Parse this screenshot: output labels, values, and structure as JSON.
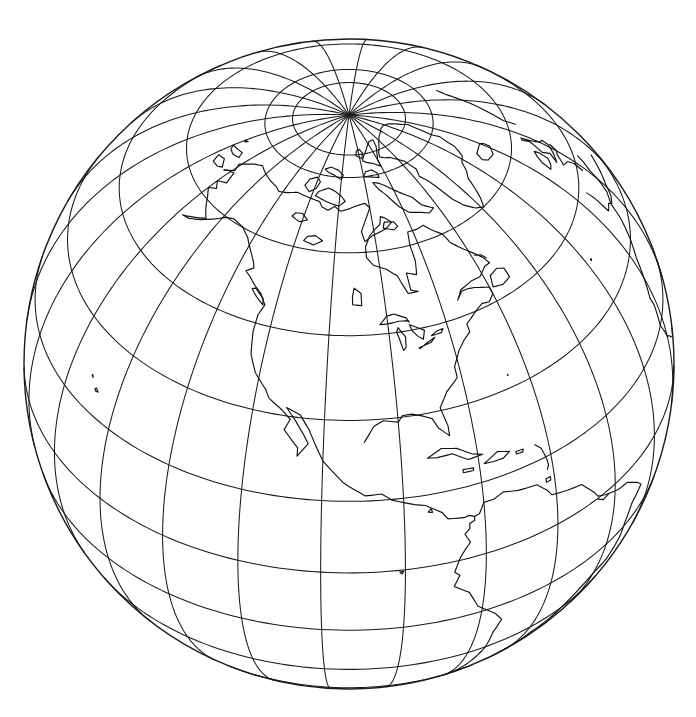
{
  "figure": {
    "title": "Orthographic globe map centered on North America",
    "kind": "map",
    "background_color": "#ffffff",
    "ink_color": "#111111",
    "line_color": "#1a1a1a"
  },
  "map": {
    "projection": "orthographic",
    "center_longitude_deg": -100,
    "center_latitude_deg": 40,
    "globe_center_x_px": 349,
    "globe_center_y_px": 364,
    "globe_radius_px": 325,
    "graticule_interval_deg": 15,
    "pole_visible": "north",
    "north_pole_x_px": 349,
    "north_pole_y_px": 131,
    "equator_label": "0",
    "latitude_lines_deg": [
      -45,
      -30,
      -15,
      0,
      15,
      30,
      45,
      60,
      75,
      80
    ],
    "longitude_lines_deg": [
      -180,
      -165,
      -150,
      -135,
      -120,
      -105,
      -90,
      -75,
      -60,
      -45,
      -30,
      -15,
      0,
      15,
      165,
      180
    ],
    "visible_regions": [
      "North America",
      "Greenland",
      "Canadian Arctic Archipelago",
      "Alaska",
      "Central America",
      "Caribbean",
      "northern South America",
      "Iceland",
      "western Europe edge",
      "northeastern Siberia edge"
    ]
  },
  "chart_data": {
    "type": "map",
    "title": "Orthographic globe map centered on North America",
    "xlabel": "longitude",
    "ylabel": "latitude",
    "projection": "orthographic",
    "center": [
      -100,
      40
    ],
    "radius_px": 325,
    "grid": true,
    "graticule_spacing_deg": 15,
    "legend": "none",
    "series": [
      {
        "name": "graticule-parallels",
        "values": [
          -75,
          -60,
          -45,
          -30,
          -15,
          0,
          15,
          30,
          45,
          60,
          75,
          80
        ]
      },
      {
        "name": "graticule-meridians",
        "values": [
          -180,
          -165,
          -150,
          -135,
          -120,
          -105,
          -90,
          -75,
          -60,
          -45,
          -30,
          -15,
          0,
          15,
          30,
          165,
          180
        ]
      }
    ]
  }
}
